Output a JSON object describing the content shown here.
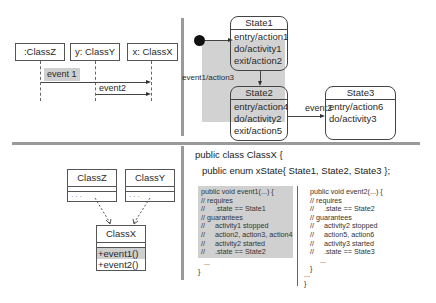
{
  "sequence_diagram": {
    "lifelines": [
      ":ClassZ",
      "y: ClassY",
      "x: ClassX"
    ],
    "messages": [
      {
        "label": "event 1",
        "from": ":ClassZ",
        "to": "x: ClassX",
        "highlighted": true
      },
      {
        "label": "event2",
        "from": "y: ClassY",
        "to": "x: ClassX",
        "highlighted": false
      }
    ]
  },
  "state_diagram": {
    "states": [
      {
        "name": "State1",
        "lines": [
          "entry/action1",
          "do/activity1",
          "exit/action2"
        ]
      },
      {
        "name": "State2",
        "lines": [
          "entry/action4",
          "do/activity2",
          "exit/action5"
        ]
      },
      {
        "name": "State3",
        "lines": [
          "entry/action6",
          "do/activity3"
        ]
      }
    ],
    "transitions": [
      {
        "label": "event1/action3",
        "from": "State1",
        "to": "State2"
      },
      {
        "label": "event2",
        "from": "State2",
        "to": "State3"
      }
    ]
  },
  "class_diagram": {
    "classes": [
      {
        "name": "ClassZ",
        "members": "· · ·"
      },
      {
        "name": "ClassY",
        "members": "· · ·"
      },
      {
        "name": "ClassX",
        "operations": [
          "+event1()",
          "+event2()"
        ]
      }
    ]
  },
  "code": {
    "class_header": "public class ClassX {",
    "enum_line": "public enum xState{ State1, State2, State3 };",
    "event1_block": "public void event1(...) {\n// requires\n//     .state == State1\n// guarantees\n//     activity1 stopped\n//     action2, action3, action4\n//     activity2 started\n//     .state == State2",
    "event1_tail": "   ...\n}",
    "event2_block": "public void event2(...) {\n// requires\n//     .state == State2\n// guarantees\n//     activity2 stopped\n//     action5, action6\n//     activity3 started\n//     .state == State3\n     ...\n}",
    "class_tail": "...\n}"
  },
  "colors": {
    "highlight": "#d0d0d0",
    "divider": "#9a9a9a"
  }
}
